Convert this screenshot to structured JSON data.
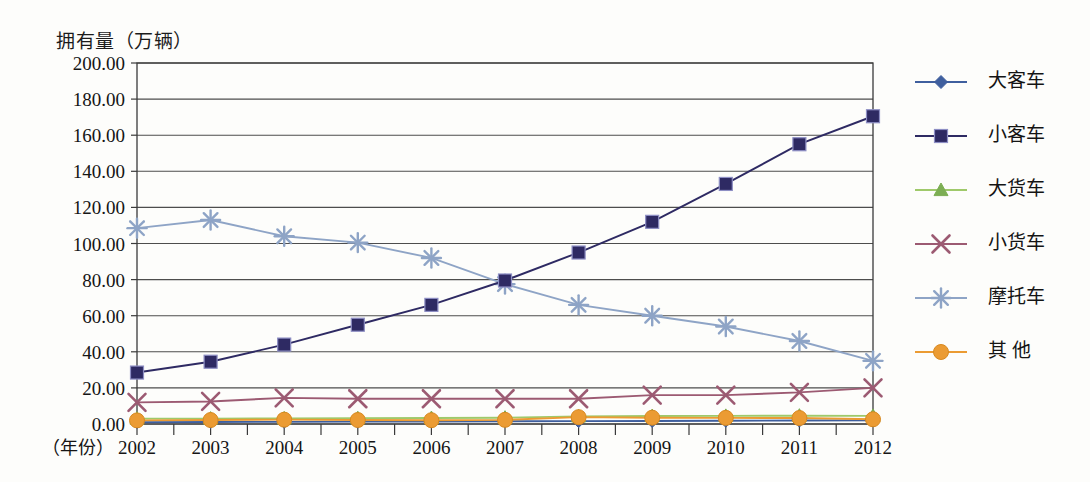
{
  "chart_data": {
    "type": "line",
    "title": "",
    "ylabel": "拥有量（万辆）",
    "xlabel": "（年份）",
    "categories": [
      "2002",
      "2003",
      "2004",
      "2005",
      "2006",
      "2007",
      "2008",
      "2009",
      "2010",
      "2011",
      "2012"
    ],
    "ylim": [
      0,
      200
    ],
    "ytick_step": 20,
    "ytick_labels": [
      "0.00",
      "20.00",
      "40.00",
      "60.00",
      "80.00",
      "100.00",
      "120.00",
      "140.00",
      "160.00",
      "180.00",
      "200.00"
    ],
    "grid": true,
    "legend_position": "right",
    "series": [
      {
        "name": "大客车",
        "marker": "diamond",
        "color": "#3f5f9e",
        "values": [
          1.0,
          1.1,
          1.2,
          1.3,
          1.4,
          1.5,
          1.6,
          1.7,
          1.8,
          1.9,
          2.0
        ]
      },
      {
        "name": "小客车",
        "marker": "square",
        "color": "#2e2a63",
        "values": [
          28.5,
          34.5,
          44.0,
          55.0,
          66.0,
          79.5,
          95.0,
          112.0,
          133.0,
          155.0,
          170.5
        ]
      },
      {
        "name": "大货车",
        "marker": "triangle",
        "color": "#9fc96a",
        "values": [
          3.0,
          3.0,
          3.1,
          3.2,
          3.3,
          3.5,
          4.2,
          4.4,
          4.5,
          4.6,
          4.5
        ]
      },
      {
        "name": "小货车",
        "marker": "x",
        "color": "#9c5a72",
        "values": [
          12.0,
          12.5,
          14.5,
          14.0,
          14.0,
          14.0,
          14.0,
          16.0,
          16.0,
          17.5,
          20.0
        ]
      },
      {
        "name": "摩托车",
        "marker": "asterisk",
        "color": "#8ea4c6",
        "values": [
          108.5,
          113.0,
          104.0,
          100.5,
          92.0,
          77.5,
          66.0,
          60.0,
          54.0,
          46.0,
          35.0
        ]
      },
      {
        "name": "其 他",
        "marker": "circle",
        "color": "#eb9b33",
        "values": [
          2.0,
          2.2,
          2.4,
          2.2,
          2.1,
          2.3,
          3.8,
          3.5,
          3.4,
          3.3,
          2.6
        ]
      }
    ]
  },
  "legend": {
    "items": [
      {
        "label": "大客车",
        "color": "#3f5f9e",
        "marker": "diamond"
      },
      {
        "label": "小客车",
        "color": "#2e2a63",
        "marker": "square"
      },
      {
        "label": "大货车",
        "color": "#9fc96a",
        "marker": "triangle"
      },
      {
        "label": "小货车",
        "color": "#9c5a72",
        "marker": "x"
      },
      {
        "label": "摩托车",
        "color": "#8ea4c6",
        "marker": "asterisk"
      },
      {
        "label": "其 他",
        "color": "#eb9b33",
        "marker": "circle"
      }
    ]
  },
  "axes": {
    "y_title": "拥有量（万辆）",
    "x_title": "（年份）"
  },
  "colors": {
    "grid": "#4d4d4d",
    "frame": "#3a3a3a",
    "background": "#fdfdfb"
  }
}
